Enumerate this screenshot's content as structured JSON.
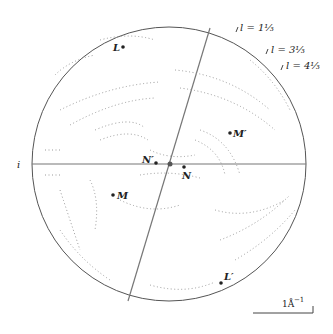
{
  "figure": {
    "axis_label_i": "i",
    "points": [
      {
        "id": "L",
        "label": "L",
        "x": 123,
        "y": 47
      },
      {
        "id": "L_prime",
        "label": "L′",
        "x": 221,
        "y": 283
      },
      {
        "id": "M",
        "label": "M",
        "x": 113,
        "y": 195
      },
      {
        "id": "M_prime",
        "label": "M′",
        "x": 230,
        "y": 133
      },
      {
        "id": "N",
        "label": "N",
        "x": 184,
        "y": 167
      },
      {
        "id": "N_prime",
        "label": "N′",
        "x": 156,
        "y": 163
      }
    ],
    "layer_lines": [
      {
        "label": "l = 1⅓"
      },
      {
        "label": "l = 3⅓"
      },
      {
        "label": "l = 4⅓"
      }
    ],
    "scale_bar": {
      "label": "1Å",
      "superscript": "−1"
    },
    "colors": {
      "line": "#777777",
      "dots": "#9a9a9a",
      "circle": "#555555"
    }
  }
}
